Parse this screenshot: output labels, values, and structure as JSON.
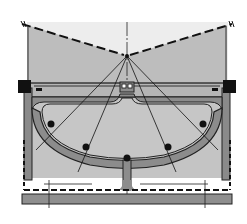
{
  "diagram": {
    "type": "engineering-cross-section",
    "colors": {
      "background": "#ffffff",
      "fill_light": "#c9c9c9",
      "fill_area": "#bcbcbc",
      "rib_fill": "#8a8a8a",
      "rib_dark": "#6e6e6e",
      "ink": "#111111",
      "base_slab": "#8f8f8f"
    },
    "apex": {
      "x": 127,
      "y": 56
    },
    "cables": [
      {
        "to_x": 52,
        "to_y": 130
      },
      {
        "to_x": 86,
        "to_y": 146
      },
      {
        "to_x": 127,
        "to_y": 158
      },
      {
        "to_x": 168,
        "to_y": 146
      },
      {
        "to_x": 202,
        "to_y": 130
      }
    ],
    "anchors": [
      {
        "x": 52,
        "y": 124
      },
      {
        "x": 86,
        "y": 148
      },
      {
        "x": 127,
        "y": 158
      },
      {
        "x": 168,
        "y": 148
      },
      {
        "x": 202,
        "y": 124
      }
    ]
  }
}
